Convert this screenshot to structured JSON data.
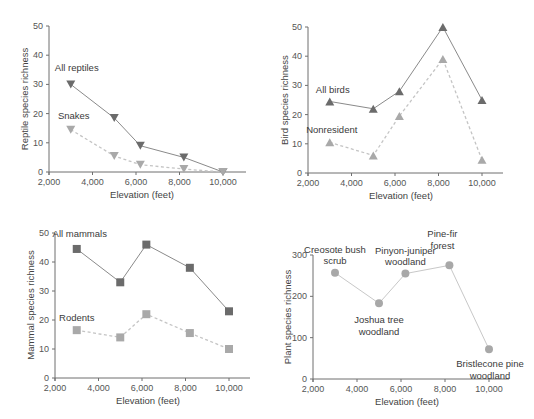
{
  "chart_data": [
    {
      "type": "line",
      "panel": "top-left",
      "title": "",
      "xlabel": "Elevation (feet)",
      "ylabel": "Reptile species richness",
      "x_ticks": [
        "2,000",
        "4,000",
        "6,000",
        "8,000",
        "10,000"
      ],
      "y_ticks": [
        "0",
        "10",
        "20",
        "30",
        "40",
        "50"
      ],
      "xlim": [
        2000,
        11000
      ],
      "ylim": [
        0,
        50
      ],
      "grid": false,
      "marker": "triangle-down",
      "series": [
        {
          "name": "All reptiles",
          "style": "solid",
          "color": "#6b6b6b",
          "x": [
            3000,
            5000,
            6200,
            8200,
            10000
          ],
          "values": [
            30,
            18.5,
            9,
            5,
            0
          ]
        },
        {
          "name": "Snakes",
          "style": "dashed",
          "color": "#a9a9a9",
          "x": [
            3000,
            5000,
            6200,
            8200,
            10000
          ],
          "values": [
            14.5,
            5.5,
            2.5,
            1,
            0
          ]
        }
      ]
    },
    {
      "type": "line",
      "panel": "top-right",
      "title": "",
      "xlabel": "Elevation (feet)",
      "ylabel": "Bird species richness",
      "x_ticks": [
        "2,000",
        "4,000",
        "6,000",
        "8,000",
        "10,000"
      ],
      "y_ticks": [
        "0",
        "10",
        "20",
        "30",
        "40",
        "50"
      ],
      "xlim": [
        2000,
        11000
      ],
      "ylim": [
        0,
        50
      ],
      "grid": false,
      "marker": "triangle-up",
      "series": [
        {
          "name": "All birds",
          "style": "solid",
          "color": "#6b6b6b",
          "x": [
            3000,
            5000,
            6200,
            8200,
            10000
          ],
          "values": [
            24.5,
            22,
            28,
            50,
            25
          ]
        },
        {
          "name": "Nonresident",
          "style": "dashed",
          "color": "#a9a9a9",
          "x": [
            3000,
            5000,
            6200,
            8200,
            10000
          ],
          "values": [
            10.5,
            6,
            19.5,
            39,
            4.5
          ]
        }
      ]
    },
    {
      "type": "line",
      "panel": "bottom-left",
      "title": "",
      "xlabel": "Elevation (feet)",
      "ylabel": "Mammal species richness",
      "x_ticks": [
        "2,000",
        "4,000",
        "6,000",
        "8,000",
        "10,000"
      ],
      "y_ticks": [
        "0",
        "10",
        "20",
        "30",
        "40",
        "50"
      ],
      "xlim": [
        2000,
        11000
      ],
      "ylim": [
        0,
        50
      ],
      "grid": false,
      "marker": "square",
      "series": [
        {
          "name": "All mammals",
          "style": "solid",
          "color": "#6b6b6b",
          "x": [
            3000,
            5000,
            6200,
            8200,
            10000
          ],
          "values": [
            44.5,
            33,
            46,
            38,
            23
          ]
        },
        {
          "name": "Rodents",
          "style": "dashed",
          "color": "#a9a9a9",
          "x": [
            3000,
            5000,
            6200,
            8200,
            10000
          ],
          "values": [
            16.5,
            14,
            22,
            15.5,
            10
          ]
        }
      ]
    },
    {
      "type": "line",
      "panel": "bottom-right",
      "title": "",
      "xlabel": "Elevation (feet)",
      "ylabel": "Plant species richness",
      "x_ticks": [
        "2,000",
        "4,000",
        "6,000",
        "8,000",
        "10,000"
      ],
      "y_ticks": [
        "0",
        "100",
        "200",
        "300"
      ],
      "xlim": [
        2000,
        11000
      ],
      "ylim": [
        0,
        300
      ],
      "grid": false,
      "marker": "circle",
      "series": [
        {
          "name": "Plants",
          "style": "solid",
          "color": "#b3b3b3",
          "x": [
            3000,
            5000,
            6200,
            8200,
            10000
          ],
          "values": [
            257,
            183,
            255,
            275,
            72
          ]
        }
      ],
      "annotations": [
        {
          "lines": [
            "Creosote bush",
            "scrub"
          ],
          "x": 3000,
          "y": 257
        },
        {
          "lines": [
            "Joshua tree",
            "woodland"
          ],
          "x": 5000,
          "y": 183
        },
        {
          "lines": [
            "Pinyon-juniper",
            "woodland"
          ],
          "x": 6200,
          "y": 255
        },
        {
          "lines": [
            "Pine-fir",
            "forest"
          ],
          "x": 8200,
          "y": 275
        },
        {
          "lines": [
            "Bristlecone pine",
            "woodland"
          ],
          "x": 10000,
          "y": 72
        }
      ]
    }
  ],
  "colors": {
    "axis": "#6f6f6f",
    "primary_series": "#6b6b6b",
    "secondary_series": "#a9a9a9",
    "plant_series": "#b3b3b3"
  }
}
